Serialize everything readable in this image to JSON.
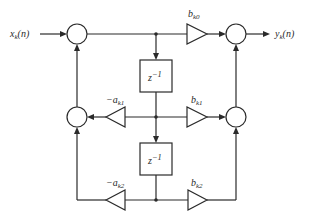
{
  "diagram": {
    "type": "Direct Form II biquad (second-order IIR section) signal-flow graph",
    "input": {
      "label": "x",
      "sub": "k",
      "arg": "(n)"
    },
    "output": {
      "label": "y",
      "sub": "k",
      "arg": "(n)"
    },
    "delays": [
      {
        "label": "z",
        "sup": "−1"
      },
      {
        "label": "z",
        "sup": "−1"
      }
    ],
    "feedforward_gains": [
      {
        "label": "b",
        "sub": "k0"
      },
      {
        "label": "b",
        "sub": "k1"
      },
      {
        "label": "b",
        "sub": "k2"
      }
    ],
    "feedback_gains": [
      {
        "label": "−a",
        "sub": "k1"
      },
      {
        "label": "−a",
        "sub": "k2"
      }
    ],
    "adders": [
      "left-top",
      "left-middle",
      "right-top",
      "right-middle"
    ],
    "colors": {
      "line": "#2a2a2a",
      "background": "#ffffff"
    }
  }
}
